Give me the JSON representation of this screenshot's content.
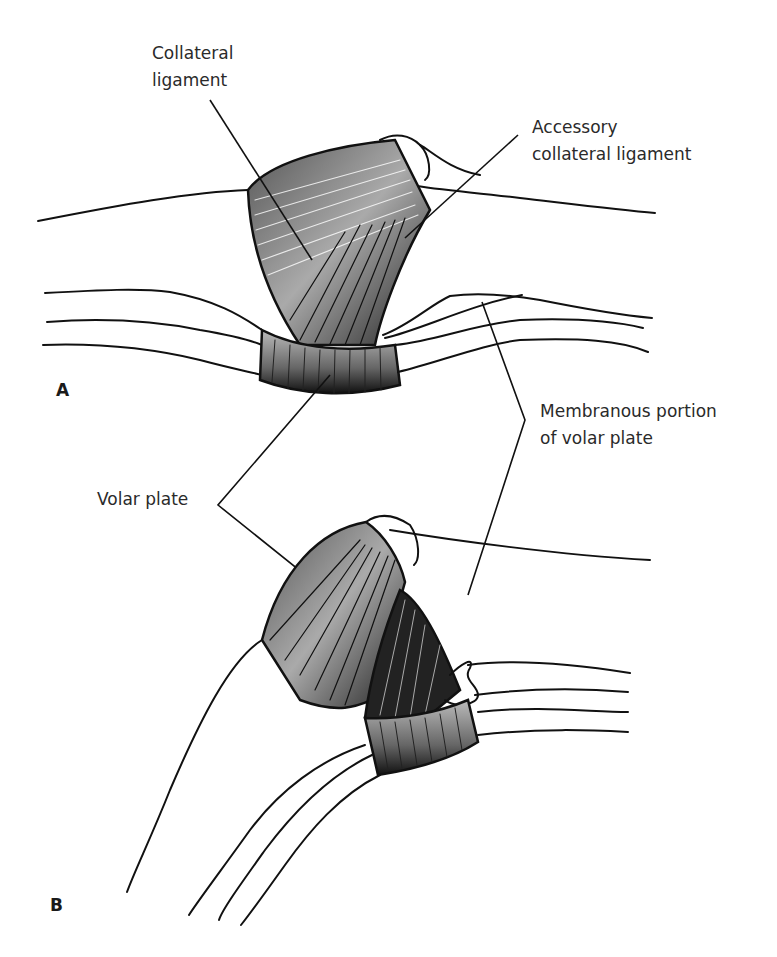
{
  "figure": {
    "panels": [
      {
        "id": "A",
        "label": "A"
      },
      {
        "id": "B",
        "label": "B"
      }
    ],
    "labels": {
      "collateral_ligament": {
        "line1": "Collateral",
        "line2": "ligament"
      },
      "accessory_collateral_ligament": {
        "line1": "Accessory",
        "line2": "collateral ligament"
      },
      "membranous_portion": {
        "line1": "Membranous portion",
        "line2": "of volar plate"
      },
      "volar_plate": {
        "line1": "Volar plate"
      }
    },
    "colors": {
      "ink": "#111111",
      "text": "#2a2a2a",
      "background": "#ffffff"
    }
  }
}
